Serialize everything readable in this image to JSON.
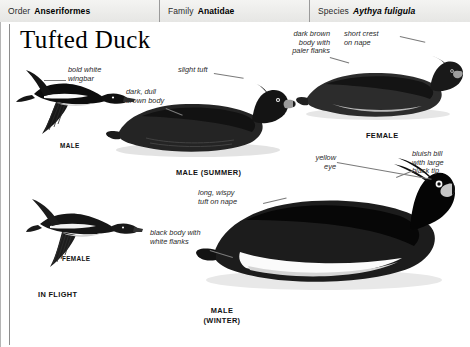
{
  "taxonomy": {
    "order_key": "Order",
    "order_value": "Anseriformes",
    "family_key": "Family",
    "family_value": "Anatidae",
    "species_key": "Species",
    "species_value": "Aythya fuligula"
  },
  "title": "Tufted Duck",
  "annotations": [
    {
      "id": "bold-white-wingbar",
      "text": "bold white\nwingbar"
    },
    {
      "id": "slight-tuft",
      "text": "slight tuft"
    },
    {
      "id": "dark-dull-brown-body",
      "text": "dark, dull\nbrown body"
    },
    {
      "id": "dark-brown-body-flanks",
      "text": "dark brown\nbody with\npaler flanks"
    },
    {
      "id": "short-crest-on-nape",
      "text": "short crest\non nape"
    },
    {
      "id": "yellow-eye",
      "text": "yellow\neye"
    },
    {
      "id": "bluish-bill-black-tip",
      "text": "bluish bill\nwith large\nblack tip"
    },
    {
      "id": "long-wispy-tuft-on-nape",
      "text": "long, wispy\ntuft on nape"
    },
    {
      "id": "black-body-white-flanks",
      "text": "black body with\nwhite flanks"
    }
  ],
  "captions": {
    "male_flight": "MALE",
    "female_flight": "FEMALE",
    "in_flight": "IN FLIGHT",
    "male_summer": "MALE (SUMMER)",
    "female_swim": "FEMALE",
    "male_winter": "MALE\n(WINTER)"
  },
  "colors": {
    "ink": "#111111",
    "annotation": "#2a2a2a",
    "leader": "#7a7a7a",
    "rule": "#9a9a9a",
    "header_bg": "#ececea",
    "paper": "#ffffff"
  }
}
